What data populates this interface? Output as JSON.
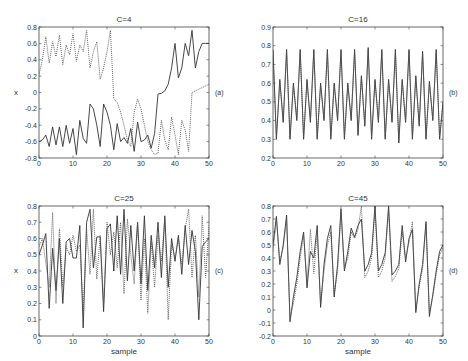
{
  "figure": {
    "panels_count": 4
  },
  "chart_data": [
    {
      "type": "line",
      "title": "C=4",
      "panel_label": "(a)",
      "xlabel": "",
      "ylabel": "x",
      "xlim": [
        0,
        50
      ],
      "ylim": [
        -0.8,
        0.8
      ],
      "xticks": [
        0,
        10,
        20,
        30,
        40,
        50
      ],
      "xtick_labels": [
        "0",
        "10",
        "20",
        "30",
        "40",
        "50"
      ],
      "yticks": [
        -0.8,
        -0.6,
        -0.4,
        -0.2,
        0,
        0.2,
        0.4,
        0.6,
        0.8
      ],
      "ytick_labels": [
        "-0.8",
        "-0.6",
        "-0.4",
        "-0.2",
        "0",
        "0.2",
        "0.4",
        "0.6",
        "0.8"
      ],
      "grid": false,
      "box": [
        39,
        27,
        209,
        158
      ],
      "series": [
        {
          "name": "solid",
          "style": "solid",
          "x": [
            0,
            1,
            2,
            3,
            4,
            5,
            6,
            7,
            8,
            9,
            10,
            11,
            12,
            13,
            14,
            15,
            16,
            17,
            18,
            19,
            20,
            21,
            22,
            23,
            24,
            25,
            26,
            27,
            28,
            29,
            30,
            31,
            32,
            33,
            34,
            35,
            36,
            37,
            38,
            39,
            40,
            41,
            42,
            43,
            44,
            45,
            46,
            47,
            48,
            49,
            50
          ],
          "values": [
            -0.6,
            -0.58,
            -0.52,
            -0.66,
            -0.42,
            -0.64,
            -0.42,
            -0.66,
            -0.4,
            -0.62,
            -0.44,
            -0.76,
            -0.34,
            -0.56,
            -0.62,
            -0.14,
            -0.2,
            -0.4,
            -0.66,
            -0.14,
            -0.24,
            -0.4,
            -0.7,
            -0.38,
            -0.6,
            -0.55,
            -0.62,
            -0.44,
            -0.72,
            -0.36,
            -0.6,
            -0.58,
            -0.52,
            -0.68,
            -0.5,
            -0.02,
            -0.01,
            0.02,
            0.1,
            0.3,
            0.6,
            0.18,
            0.3,
            0.6,
            0.45,
            0.76,
            0.3,
            0.5,
            0.6,
            0.6,
            0.6
          ]
        },
        {
          "name": "dotted",
          "style": "dotted",
          "x": [
            0,
            1,
            2,
            3,
            4,
            5,
            6,
            7,
            8,
            9,
            10,
            11,
            12,
            13,
            14,
            15,
            16,
            17,
            18,
            19,
            20,
            21,
            22,
            23,
            24,
            25,
            26,
            27,
            28,
            29,
            30,
            31,
            32,
            33,
            34,
            35,
            36,
            37,
            38,
            39,
            40,
            41,
            42,
            43,
            44,
            45,
            46,
            47,
            48,
            49,
            50
          ],
          "values": [
            0.22,
            0.4,
            0.68,
            0.36,
            0.62,
            0.44,
            0.7,
            0.34,
            0.58,
            0.46,
            0.72,
            0.38,
            0.58,
            0.5,
            0.76,
            0.3,
            0.5,
            0.62,
            0.16,
            0.3,
            0.5,
            0.76,
            -0.08,
            -0.12,
            -0.24,
            -0.4,
            -0.58,
            -0.66,
            -0.24,
            -0.08,
            -0.2,
            -0.4,
            -0.6,
            -0.7,
            -0.76,
            -0.74,
            -0.34,
            -0.58,
            -0.7,
            -0.3,
            -0.52,
            -0.76,
            -0.34,
            -0.46,
            -0.72,
            0.0,
            0.02,
            0.04,
            0.06,
            0.08,
            0.1
          ]
        }
      ]
    },
    {
      "type": "line",
      "title": "C=16",
      "panel_label": "(b)",
      "xlabel": "",
      "ylabel": "",
      "xlim": [
        0,
        50
      ],
      "ylim": [
        0.2,
        0.9
      ],
      "xticks": [
        0,
        10,
        20,
        30,
        40,
        50
      ],
      "xtick_labels": [
        "0",
        "10",
        "20",
        "30",
        "40",
        "50"
      ],
      "yticks": [
        0.2,
        0.3,
        0.4,
        0.5,
        0.6,
        0.7,
        0.8,
        0.9
      ],
      "ytick_labels": [
        "0.2",
        "0.3",
        "0.4",
        "0.5",
        "0.6",
        "0.7",
        "0.8",
        "0.9"
      ],
      "grid": false,
      "box": [
        273,
        27,
        443,
        158
      ],
      "series": [
        {
          "name": "solid",
          "style": "solid",
          "x": [
            0,
            1,
            2,
            3,
            4,
            5,
            6,
            7,
            8,
            9,
            10,
            11,
            12,
            13,
            14,
            15,
            16,
            17,
            18,
            19,
            20,
            21,
            22,
            23,
            24,
            25,
            26,
            27,
            28,
            29,
            30,
            31,
            32,
            33,
            34,
            35,
            36,
            37,
            38,
            39,
            40,
            41,
            42,
            43,
            44,
            45,
            46,
            47,
            48,
            49,
            50
          ],
          "values": [
            0.78,
            0.3,
            0.62,
            0.39,
            0.78,
            0.3,
            0.6,
            0.4,
            0.78,
            0.3,
            0.62,
            0.39,
            0.78,
            0.3,
            0.6,
            0.4,
            0.78,
            0.3,
            0.6,
            0.4,
            0.78,
            0.3,
            0.6,
            0.4,
            0.78,
            0.32,
            0.64,
            0.37,
            0.79,
            0.3,
            0.62,
            0.39,
            0.78,
            0.3,
            0.62,
            0.39,
            0.78,
            0.28,
            0.62,
            0.39,
            0.78,
            0.3,
            0.64,
            0.37,
            0.77,
            0.3,
            0.61,
            0.4,
            0.78,
            0.3,
            0.5
          ]
        },
        {
          "name": "dotted",
          "style": "dotted",
          "x": [
            0,
            1,
            2,
            3,
            4,
            5,
            6,
            7,
            8,
            9,
            10,
            11,
            12,
            13,
            14,
            15,
            16,
            17,
            18,
            19,
            20,
            21,
            22,
            23,
            24,
            25,
            26,
            27,
            28,
            29,
            30,
            31,
            32,
            33,
            34,
            35,
            36,
            37,
            38,
            39,
            40,
            41,
            42,
            43,
            44,
            45,
            46,
            47,
            48,
            49,
            50
          ],
          "values": [
            0.77,
            0.31,
            0.61,
            0.4,
            0.77,
            0.31,
            0.59,
            0.41,
            0.77,
            0.31,
            0.61,
            0.4,
            0.77,
            0.31,
            0.59,
            0.41,
            0.77,
            0.31,
            0.59,
            0.41,
            0.77,
            0.31,
            0.59,
            0.41,
            0.77,
            0.33,
            0.63,
            0.38,
            0.78,
            0.31,
            0.61,
            0.4,
            0.77,
            0.31,
            0.61,
            0.4,
            0.77,
            0.29,
            0.61,
            0.4,
            0.77,
            0.31,
            0.63,
            0.38,
            0.76,
            0.31,
            0.6,
            0.41,
            0.77,
            0.31,
            0.49
          ]
        }
      ]
    },
    {
      "type": "line",
      "title": "C=25",
      "panel_label": "(c)",
      "xlabel": "sample",
      "ylabel": "x",
      "xlim": [
        0,
        50
      ],
      "ylim": [
        0,
        0.8
      ],
      "xticks": [
        0,
        10,
        20,
        30,
        40,
        50
      ],
      "xtick_labels": [
        "0",
        "10",
        "20",
        "30",
        "40",
        "50"
      ],
      "yticks": [
        0,
        0.1,
        0.2,
        0.3,
        0.4,
        0.5,
        0.6,
        0.7,
        0.8
      ],
      "ytick_labels": [
        "0",
        "0.1",
        "0.2",
        "0.3",
        "0.4",
        "0.5",
        "0.6",
        "0.7",
        "0.8"
      ],
      "grid": false,
      "box": [
        39,
        206,
        209,
        336
      ],
      "series": [
        {
          "name": "solid",
          "style": "solid",
          "x": [
            0,
            1,
            2,
            3,
            4,
            5,
            6,
            7,
            8,
            9,
            10,
            11,
            12,
            13,
            14,
            15,
            16,
            17,
            18,
            19,
            20,
            21,
            22,
            23,
            24,
            25,
            26,
            27,
            28,
            29,
            30,
            31,
            32,
            33,
            34,
            35,
            36,
            37,
            38,
            39,
            40,
            41,
            42,
            43,
            44,
            45,
            46,
            47,
            48,
            49,
            50
          ],
          "values": [
            0.5,
            0.56,
            0.63,
            0.17,
            0.54,
            0.28,
            0.6,
            0.2,
            0.58,
            0.6,
            0.48,
            0.48,
            0.68,
            0.05,
            0.7,
            0.78,
            0.42,
            0.61,
            0.61,
            0.15,
            0.66,
            0.69,
            0.4,
            0.74,
            0.38,
            0.78,
            0.34,
            0.68,
            0.4,
            0.7,
            0.32,
            0.74,
            0.28,
            0.62,
            0.42,
            0.7,
            0.36,
            0.74,
            0.3,
            0.6,
            0.46,
            0.62,
            0.38,
            0.68,
            0.44,
            0.65,
            0.52,
            0.1,
            0.55,
            0.58,
            0.6
          ]
        },
        {
          "name": "dotted",
          "style": "dotted",
          "x": [
            0,
            1,
            2,
            3,
            4,
            5,
            6,
            7,
            8,
            9,
            10,
            11,
            12,
            13,
            14,
            15,
            16,
            17,
            18,
            19,
            20,
            21,
            22,
            23,
            24,
            25,
            26,
            27,
            28,
            29,
            30,
            31,
            32,
            33,
            34,
            35,
            36,
            37,
            38,
            39,
            40,
            41,
            42,
            43,
            44,
            45,
            46,
            47,
            48,
            49,
            50
          ],
          "values": [
            0.55,
            0.6,
            0.45,
            0.3,
            0.76,
            0.2,
            0.66,
            0.3,
            0.55,
            0.5,
            0.62,
            0.52,
            0.56,
            0.15,
            0.66,
            0.38,
            0.78,
            0.35,
            0.62,
            0.2,
            0.7,
            0.5,
            0.64,
            0.42,
            0.7,
            0.26,
            0.72,
            0.5,
            0.32,
            0.7,
            0.22,
            0.6,
            0.14,
            0.58,
            0.3,
            0.62,
            0.46,
            0.72,
            0.1,
            0.56,
            0.48,
            0.6,
            0.44,
            0.66,
            0.78,
            0.36,
            0.62,
            0.24,
            0.74,
            0.36,
            0.68
          ]
        }
      ]
    },
    {
      "type": "line",
      "title": "C=45",
      "panel_label": "(d)",
      "xlabel": "sample",
      "ylabel": "",
      "xlim": [
        0,
        50
      ],
      "ylim": [
        -0.2,
        0.8
      ],
      "xticks": [
        0,
        10,
        20,
        30,
        40,
        50
      ],
      "xtick_labels": [
        "0",
        "10",
        "20",
        "30",
        "40",
        "50"
      ],
      "yticks": [
        -0.2,
        -0.1,
        0,
        0.1,
        0.2,
        0.3,
        0.4,
        0.5,
        0.6,
        0.7,
        0.8
      ],
      "ytick_labels": [
        "-0.2",
        "-0.1",
        "0",
        "0.1",
        "0.2",
        "0.3",
        "0.4",
        "0.5",
        "0.6",
        "0.7",
        "0.8"
      ],
      "grid": false,
      "box": [
        273,
        206,
        443,
        336
      ],
      "series": [
        {
          "name": "solid",
          "style": "solid",
          "x": [
            0,
            1,
            2,
            3,
            4,
            5,
            6,
            7,
            8,
            9,
            10,
            11,
            12,
            13,
            14,
            15,
            16,
            17,
            18,
            19,
            20,
            21,
            22,
            23,
            24,
            25,
            26,
            27,
            28,
            29,
            30,
            31,
            32,
            33,
            34,
            35,
            36,
            37,
            38,
            39,
            40,
            41,
            42,
            43,
            44,
            45,
            46,
            47,
            48,
            49,
            50
          ],
          "values": [
            0.5,
            0.72,
            0.35,
            0.5,
            0.73,
            -0.09,
            0.1,
            0.25,
            0.45,
            0.6,
            0.17,
            0.45,
            0.4,
            0.65,
            0.02,
            0.35,
            0.55,
            0.65,
            0.1,
            0.35,
            0.78,
            0.3,
            0.45,
            0.63,
            0.56,
            0.65,
            0.7,
            0.3,
            0.35,
            0.44,
            0.8,
            0.3,
            0.35,
            0.44,
            0.8,
            0.27,
            0.3,
            0.35,
            0.65,
            0.37,
            0.55,
            0.62,
            -0.02,
            0.2,
            0.35,
            0.68,
            -0.05,
            0.12,
            0.3,
            0.45,
            0.5
          ]
        },
        {
          "name": "dotted",
          "style": "dotted",
          "x": [
            0,
            1,
            2,
            3,
            4,
            5,
            6,
            7,
            8,
            9,
            10,
            11,
            12,
            13,
            14,
            15,
            16,
            17,
            18,
            19,
            20,
            21,
            22,
            23,
            24,
            25,
            26,
            27,
            28,
            29,
            30,
            31,
            32,
            33,
            34,
            35,
            36,
            37,
            38,
            39,
            40,
            41,
            42,
            43,
            44,
            45,
            46,
            47,
            48,
            49,
            50
          ],
          "values": [
            0.45,
            0.7,
            0.38,
            0.48,
            0.7,
            -0.06,
            0.05,
            0.2,
            0.4,
            0.58,
            0.2,
            0.62,
            0.28,
            0.6,
            0.05,
            0.3,
            0.5,
            0.6,
            0.12,
            0.3,
            0.75,
            0.32,
            0.4,
            0.6,
            0.55,
            0.62,
            0.8,
            0.25,
            0.3,
            0.4,
            0.78,
            0.25,
            0.3,
            0.4,
            0.78,
            0.22,
            0.26,
            0.32,
            0.6,
            0.4,
            0.52,
            0.68,
            0.0,
            0.18,
            0.32,
            0.66,
            -0.02,
            0.1,
            0.28,
            0.42,
            0.48
          ]
        }
      ]
    }
  ]
}
